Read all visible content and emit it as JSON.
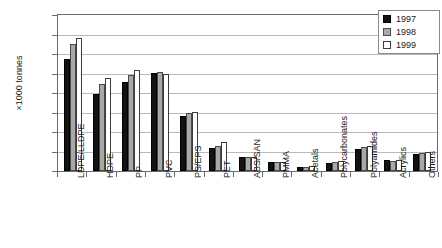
{
  "chart_data": {
    "type": "bar",
    "title": "",
    "xlabel": "",
    "ylabel": "×1000 tonnes",
    "ylim": [
      0,
      8000
    ],
    "yticks": [
      0,
      1000,
      2000,
      3000,
      4000,
      5000,
      6000,
      7000,
      8000
    ],
    "grid": true,
    "legend_position": "top-right",
    "categories": [
      "LDPE/LLDPE",
      "HDPE",
      "PP",
      "PVC",
      "PS/EPS",
      "PET",
      "ABS/SAN",
      "PMMA",
      "Acetals",
      "Polycarbonates",
      "Polyamides",
      "Acrylics",
      "Others"
    ],
    "series": [
      {
        "name": "1997",
        "color": "#121212",
        "values": [
          5750,
          3950,
          4550,
          5050,
          2800,
          1200,
          700,
          450,
          200,
          400,
          1150,
          570,
          850
        ]
      },
      {
        "name": "1998",
        "color": "#a8a8a8",
        "values": [
          6500,
          4450,
          4900,
          5080,
          2950,
          1300,
          700,
          450,
          220,
          450,
          1250,
          520,
          920
        ]
      },
      {
        "name": "1999",
        "color": "#ffffff",
        "values": [
          6800,
          4750,
          5200,
          5000,
          3050,
          1500,
          700,
          450,
          240,
          500,
          1300,
          560,
          950
        ]
      }
    ]
  },
  "legend": {
    "items": [
      {
        "label": "1997",
        "color": "#121212"
      },
      {
        "label": "1998",
        "color": "#a8a8a8"
      },
      {
        "label": "1999",
        "color": "#ffffff"
      }
    ]
  }
}
